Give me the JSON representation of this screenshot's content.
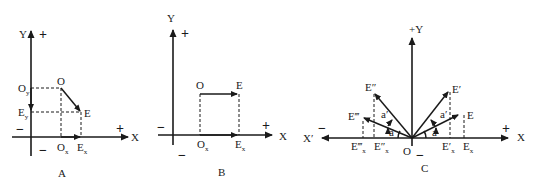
{
  "diagram_A": {
    "caption": "A",
    "y_axis": "Y",
    "x_axis": "X",
    "plus_y": "+",
    "plus_x": "+",
    "minus_x": "−",
    "minus_y": "−",
    "point_O": "O",
    "point_E": "E",
    "Oy": "O",
    "Oy_sub": "y",
    "Ey": "E",
    "Ey_sub": "y",
    "Ox": "O",
    "Ox_sub": "x",
    "Ex": "E",
    "Ex_sub": "x"
  },
  "diagram_B": {
    "caption": "B",
    "y_axis": "Y",
    "x_axis": "X",
    "plus_y": "+",
    "plus_x": "+",
    "minus_x": "−",
    "minus_y": "−",
    "point_O": "O",
    "point_E": "E",
    "Ox": "O",
    "Ox_sub": "x",
    "Ex": "E",
    "Ex_sub": "x"
  },
  "diagram_C": {
    "caption": "C",
    "y_axis": "+Y",
    "x_axis": "X",
    "x_neg_axis": "X′",
    "plus_x": "+",
    "minus_x": "−",
    "minus_y": "−",
    "origin": "O",
    "E": "E",
    "E1": "E′",
    "E2": "E″",
    "E3": "E‴",
    "Ex": "E",
    "Ex_sub": "x",
    "E1x": "E′",
    "E1x_sub": "x",
    "E2x": "E″",
    "E2x_sub": "x",
    "E3x": "E‴",
    "E3x_sub": "x",
    "angle_a": "a",
    "angle_a1": "a′"
  }
}
